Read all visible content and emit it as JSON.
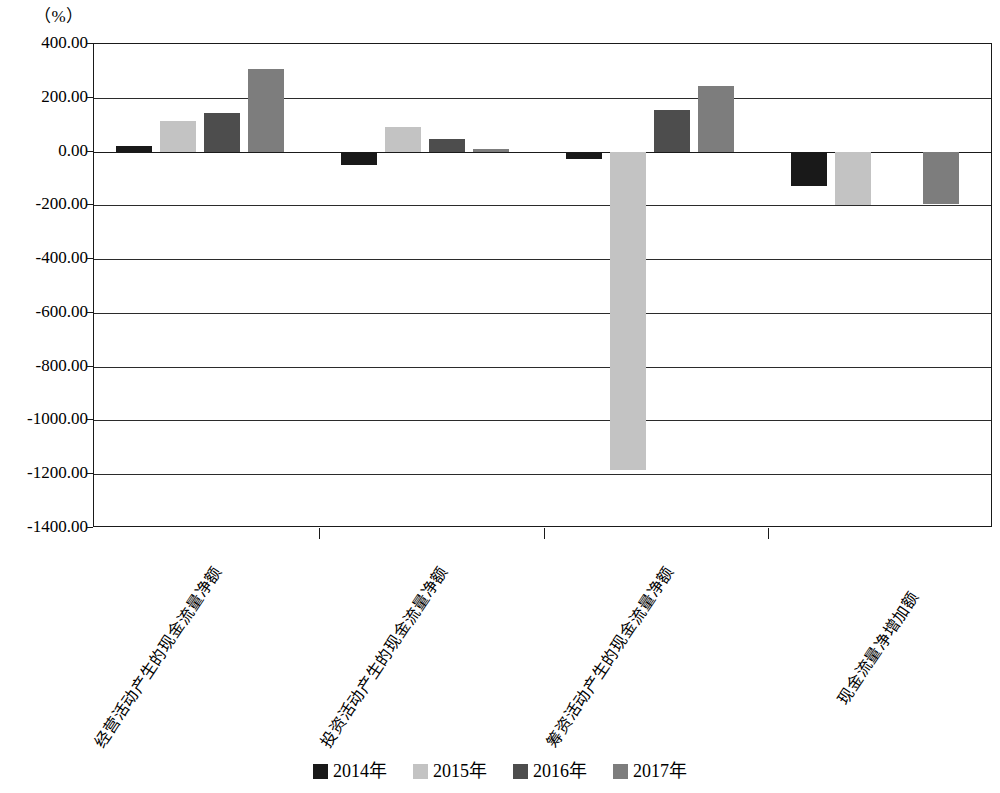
{
  "unit_label": "（%）",
  "chart_data": {
    "type": "bar",
    "title": "",
    "subtitle": "",
    "xlabel": "",
    "ylabel": "",
    "unit": "%",
    "ylim": [
      -1400,
      400
    ],
    "ytick_step": 200,
    "grid": true,
    "legend_position": "bottom",
    "ytick_labels": [
      "400.00",
      "200.00",
      "0.00",
      "-200.00",
      "-400.00",
      "-600.00",
      "-800.00",
      "-1000.00",
      "-1200.00",
      "-1400.00"
    ],
    "ytick_values": [
      400,
      200,
      0,
      -200,
      -400,
      -600,
      -800,
      -1000,
      -1200,
      -1400
    ],
    "categories": [
      "经营活动产生的现金流量净额",
      "投资活动产生的现金流量净额",
      "筹资活动产生的现金流量净额",
      "现金流量净增加额"
    ],
    "series": [
      {
        "name": "2014年",
        "color": "#191919",
        "values": [
          20,
          -50,
          -28,
          -128
        ]
      },
      {
        "name": "2015年",
        "color": "#c3c3c3",
        "values": [
          115,
          90,
          -1185,
          -200
        ]
      },
      {
        "name": "2016年",
        "color": "#4d4d4d",
        "values": [
          145,
          45,
          155,
          0
        ]
      },
      {
        "name": "2017年",
        "color": "#7d7d7d",
        "values": [
          307,
          10,
          245,
          -195
        ]
      }
    ]
  },
  "legend": {
    "items": [
      {
        "label": "2014年",
        "color": "#191919"
      },
      {
        "label": "2015年",
        "color": "#c3c3c3"
      },
      {
        "label": "2016年",
        "color": "#4d4d4d"
      },
      {
        "label": "2017年",
        "color": "#7d7d7d"
      }
    ]
  }
}
